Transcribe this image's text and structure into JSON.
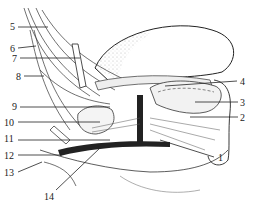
{
  "figure": {
    "type": "anatomical-illustration",
    "colors": {
      "ink": "#222222",
      "stipple": "#9a9a9a",
      "background": "#ffffff"
    }
  },
  "labels": [
    {
      "id": "1",
      "text": "1",
      "x": 218,
      "y": 153,
      "line": [
        [
          214,
          157
        ],
        [
          160,
          140
        ]
      ]
    },
    {
      "id": "2",
      "text": "2",
      "x": 240,
      "y": 113,
      "line": [
        [
          238,
          117
        ],
        [
          190,
          117
        ]
      ]
    },
    {
      "id": "3",
      "text": "3",
      "x": 240,
      "y": 98,
      "line": [
        [
          238,
          102
        ],
        [
          195,
          102
        ]
      ]
    },
    {
      "id": "4",
      "text": "4",
      "x": 240,
      "y": 77,
      "line": [
        [
          237,
          81
        ],
        [
          165,
          86
        ]
      ]
    },
    {
      "id": "5",
      "text": "5",
      "x": 10,
      "y": 22,
      "line": [
        [
          18,
          27
        ],
        [
          48,
          27
        ]
      ]
    },
    {
      "id": "6",
      "text": "6",
      "x": 10,
      "y": 44,
      "line": [
        [
          18,
          48
        ],
        [
          36,
          46
        ]
      ]
    },
    {
      "id": "7",
      "text": "7",
      "x": 12,
      "y": 54,
      "line": [
        [
          20,
          58
        ],
        [
          80,
          58
        ]
      ]
    },
    {
      "id": "8",
      "text": "8",
      "x": 16,
      "y": 72,
      "line": [
        [
          24,
          76
        ],
        [
          44,
          76
        ]
      ]
    },
    {
      "id": "9",
      "text": "9",
      "x": 12,
      "y": 102,
      "line": [
        [
          20,
          107
        ],
        [
          110,
          107
        ]
      ]
    },
    {
      "id": "10",
      "text": "10",
      "x": 4,
      "y": 118,
      "line": [
        [
          18,
          122
        ],
        [
          100,
          122
        ]
      ]
    },
    {
      "id": "11",
      "text": "11",
      "x": 4,
      "y": 134,
      "line": [
        [
          18,
          140
        ],
        [
          110,
          140
        ]
      ]
    },
    {
      "id": "12",
      "text": "12",
      "x": 4,
      "y": 151,
      "line": [
        [
          18,
          155
        ],
        [
          62,
          155
        ]
      ]
    },
    {
      "id": "13",
      "text": "13",
      "x": 4,
      "y": 168,
      "line": [
        [
          18,
          172
        ],
        [
          42,
          162
        ]
      ]
    },
    {
      "id": "14",
      "text": "14",
      "x": 44,
      "y": 192,
      "line": [
        [
          56,
          190
        ],
        [
          100,
          148
        ]
      ]
    }
  ],
  "caption": ""
}
